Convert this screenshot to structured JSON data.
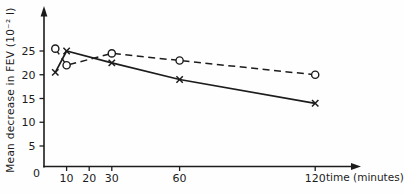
{
  "colors": {
    "ink": "#1c1c1c",
    "background": "#fefefe"
  },
  "chart_data": {
    "type": "line",
    "title": "",
    "xlabel": "time (minutes)",
    "ylabel": "Mean decrease in FEV (10⁻² l)",
    "origin_label": "0",
    "x_ticks": [
      10,
      20,
      30,
      60,
      120
    ],
    "y_ticks": [
      5,
      10,
      15,
      20,
      25
    ],
    "xlim": [
      0,
      130
    ],
    "ylim": [
      0,
      27
    ],
    "grid": false,
    "legend_position": "none",
    "x": [
      5,
      10,
      30,
      60,
      120
    ],
    "series": [
      {
        "name": "open-circle-dashed",
        "marker": "circle",
        "line_style": "dashed",
        "values": [
          25.5,
          22,
          24.5,
          23,
          20
        ]
      },
      {
        "name": "cross-solid",
        "marker": "x",
        "line_style": "solid",
        "values": [
          20.5,
          25,
          22.5,
          19,
          14
        ]
      }
    ]
  }
}
